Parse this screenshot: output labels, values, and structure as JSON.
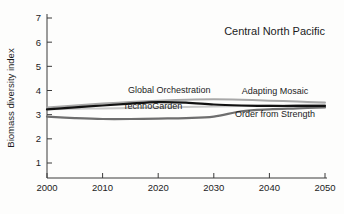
{
  "chart_data": {
    "type": "line",
    "title": "Central North Pacific",
    "xlabel": "",
    "ylabel": "Biomass diversity index",
    "xlim": [
      2000,
      2050
    ],
    "ylim": [
      0,
      7
    ],
    "grid": false,
    "legend_position": "inline-labels",
    "xticks": [
      2000,
      2010,
      2020,
      2030,
      2040,
      2050
    ],
    "yticks": [
      1,
      2,
      3,
      4,
      5,
      6,
      7
    ],
    "x": [
      2000,
      2005,
      2010,
      2015,
      2020,
      2025,
      2030,
      2035,
      2040,
      2045,
      2050
    ],
    "series": [
      {
        "name": "Global Orchestration",
        "color": "#a8a8a8",
        "width": 2.0,
        "values": [
          3.3,
          3.38,
          3.46,
          3.52,
          3.58,
          3.62,
          3.64,
          3.62,
          3.58,
          3.54,
          3.5
        ],
        "label_x": 2022,
        "label_y": 3.9
      },
      {
        "name": "Adapting Mosaic",
        "color": "#c9c9c9",
        "width": 2.0,
        "values": [
          3.22,
          3.24,
          3.26,
          3.28,
          3.3,
          3.32,
          3.34,
          3.36,
          3.38,
          3.4,
          3.42
        ],
        "label_x": 2041,
        "label_y": 3.86
      },
      {
        "name": "TechnoGarden",
        "color": "#111111",
        "width": 2.2,
        "values": [
          3.22,
          3.3,
          3.38,
          3.46,
          3.52,
          3.5,
          3.42,
          3.38,
          3.36,
          3.36,
          3.36
        ],
        "label_x": 2019,
        "label_y": 3.22
      },
      {
        "name": "Order from Strength",
        "color": "#6e6e6e",
        "width": 2.2,
        "values": [
          2.92,
          2.86,
          2.82,
          2.82,
          2.84,
          2.86,
          2.92,
          3.14,
          3.22,
          3.26,
          3.3
        ],
        "label_x": 2041,
        "label_y": 2.9
      }
    ]
  }
}
